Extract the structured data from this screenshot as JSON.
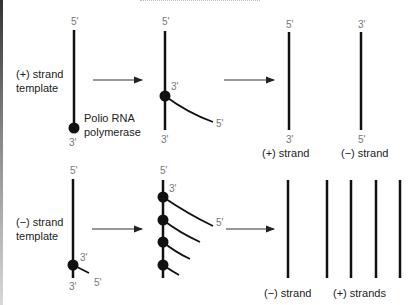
{
  "top_row": {
    "template_label_line1": "(+) strand",
    "template_label_line2": "template",
    "polymerase_label_line1": "Polio RNA",
    "polymerase_label_line2": "polymerase",
    "step1": {
      "top": "5'",
      "bottom": "3'"
    },
    "step2": {
      "top": "5'",
      "bottom": "3'",
      "new_3": "3'",
      "new_5": "5'"
    },
    "result_plus": {
      "top": "5'",
      "bottom": "3'",
      "label": "(+) strand"
    },
    "result_minus": {
      "top": "3'",
      "bottom": "5'",
      "label": "(−) strand"
    }
  },
  "bottom_row": {
    "template_label_line1": "(−) strand",
    "template_label_line2": "template",
    "step1": {
      "top": "5'",
      "bottom": "3'",
      "new_3": "3'",
      "new_5": "5'"
    },
    "step2": {
      "top": "5'",
      "new_3": "3'",
      "new_5": "5'",
      "polymerase_count": 4
    },
    "result_minus_label": "(−) strand",
    "result_plus_label": "(+) strands",
    "plus_strand_count": 4
  },
  "colors": {
    "strand": "#111111",
    "arrow": "#333333",
    "prime_label": "#777777",
    "text": "#222222"
  }
}
